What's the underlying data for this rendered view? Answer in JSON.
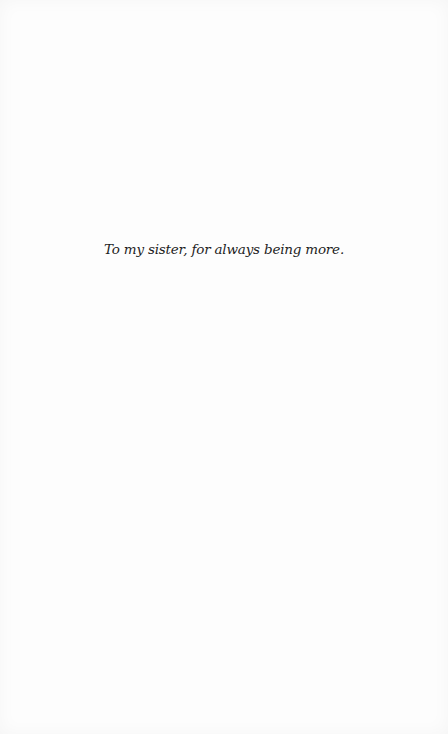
{
  "page": {
    "type": "dedication",
    "dedication_text": "To my sister, for always being more.",
    "colors": {
      "background": "#fdfdfd",
      "text": "#1e1e1e"
    }
  }
}
